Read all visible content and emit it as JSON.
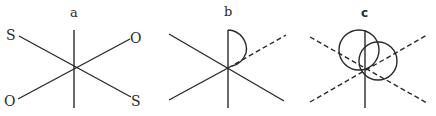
{
  "figure": {
    "panels": [
      {
        "id": "a",
        "label": "a",
        "atoms": [
          {
            "label": "S",
            "position": "upper-left"
          },
          {
            "label": "O",
            "position": "upper-right"
          },
          {
            "label": "O",
            "position": "lower-left"
          },
          {
            "label": "S",
            "position": "lower-right"
          }
        ],
        "description": "Three solid crossing bonds: vertical axis and two diagonals terminated by S and O atoms"
      },
      {
        "id": "b",
        "label": "b",
        "description": "Crossing bonds with one dashed diagonal (upper-right) and a semicircular lobe between the vertical axis and the dashed bond"
      },
      {
        "id": "c",
        "label": "c",
        "description": "Dashed diagonal bonds with solid vertical axis and two overlapping circular lobes near the center"
      }
    ],
    "colors": {
      "ink": "#2a2a2a",
      "background": "#ffffff"
    }
  }
}
